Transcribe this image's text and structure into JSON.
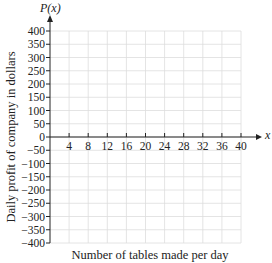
{
  "chart_data": {
    "type": "line",
    "title": "",
    "xlabel": "Number of tables made per day",
    "ylabel": "Daily profit of company in dollars",
    "function_label": "P(x)",
    "x_axis_var": "x",
    "xlim": [
      0,
      40
    ],
    "ylim": [
      -400,
      400
    ],
    "x_ticks": [
      4,
      8,
      12,
      16,
      20,
      24,
      28,
      32,
      36,
      40
    ],
    "y_ticks": [
      400,
      350,
      300,
      250,
      200,
      150,
      100,
      50,
      0,
      -50,
      -100,
      -150,
      -200,
      -250,
      -300,
      -350,
      -400
    ],
    "grid": true,
    "series": [],
    "legend": null
  },
  "colors": {
    "axis": "#222222",
    "grid": "#dddddd",
    "text": "#222222"
  }
}
